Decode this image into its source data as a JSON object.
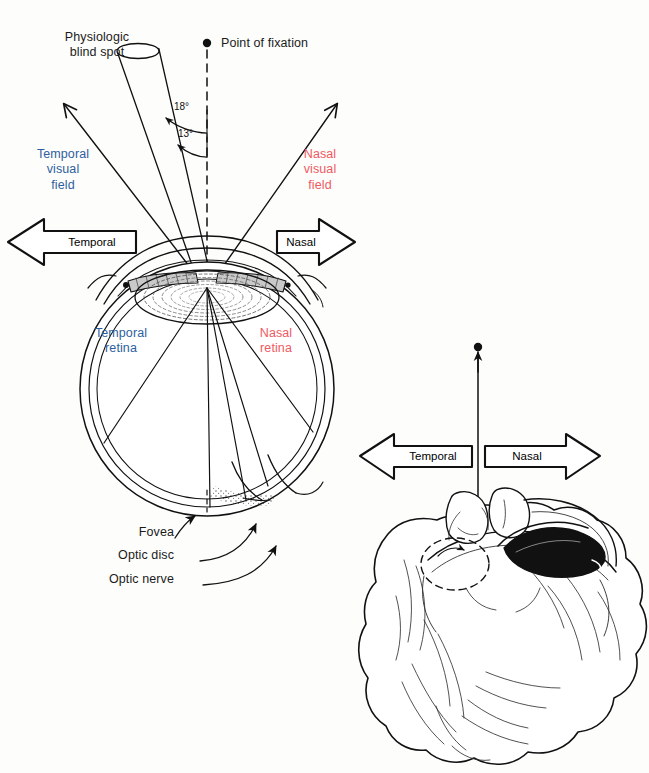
{
  "figure": {
    "background_color": "#fdfdfc",
    "ink_color": "#111111",
    "accent_blue": "#2d5f9e",
    "accent_red": "#ef5a62"
  },
  "labels": {
    "blind_spot": "Physiologic\nblind spot",
    "point_of_fixation": "Point of fixation",
    "temporal_visual_field": "Temporal\nvisual\nfield",
    "nasal_visual_field": "Nasal\nvisual\nfield",
    "temporal_retina": "Temporal\nretina",
    "nasal_retina": "Nasal\nretina",
    "fovea": "Fovea",
    "optic_disc": "Optic disc",
    "optic_nerve": "Optic nerve"
  },
  "angles": {
    "outer": "18°",
    "inner": "13°"
  },
  "banners": {
    "eye_temporal": "Temporal",
    "eye_nasal": "Nasal",
    "head_temporal": "Temporal",
    "head_nasal": "Nasal"
  },
  "icons": {
    "fixation_dot": "fixation-dot-icon",
    "head_fixation_dot": "head-fixation-dot-icon",
    "blind_spot_cone": "blind-spot-cone-icon",
    "eyeball": "eyeball-icon",
    "lens": "lens-icon",
    "optic_nerve_stalk": "optic-nerve-stalk-icon",
    "head_top_view": "head-top-view-icon",
    "left_arrow_banner": "left-arrow-banner-icon",
    "right_arrow_banner": "right-arrow-banner-icon"
  }
}
